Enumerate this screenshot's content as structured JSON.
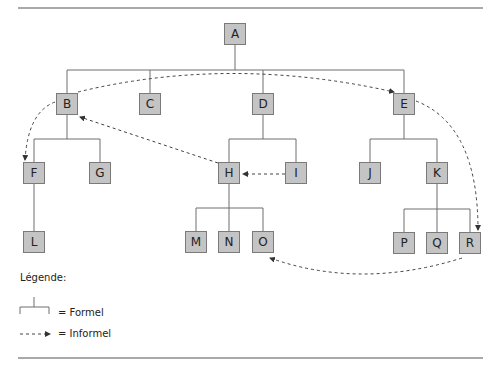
{
  "diagram": {
    "type": "organizational-chart",
    "nodes": [
      {
        "id": "A",
        "label": "A",
        "x": 224,
        "y": 23
      },
      {
        "id": "B",
        "label": "B",
        "x": 56,
        "y": 93
      },
      {
        "id": "C",
        "label": "C",
        "x": 139,
        "y": 93
      },
      {
        "id": "D",
        "label": "D",
        "x": 252,
        "y": 93
      },
      {
        "id": "E",
        "label": "E",
        "x": 393,
        "y": 93
      },
      {
        "id": "F",
        "label": "F",
        "x": 23,
        "y": 162
      },
      {
        "id": "G",
        "label": "G",
        "x": 89,
        "y": 162
      },
      {
        "id": "H",
        "label": "H",
        "x": 218,
        "y": 162
      },
      {
        "id": "I",
        "label": "I",
        "x": 285,
        "y": 162
      },
      {
        "id": "J",
        "label": "J",
        "x": 359,
        "y": 162
      },
      {
        "id": "K",
        "label": "K",
        "x": 426,
        "y": 162
      },
      {
        "id": "L",
        "label": "L",
        "x": 23,
        "y": 231
      },
      {
        "id": "M",
        "label": "M",
        "x": 185,
        "y": 231
      },
      {
        "id": "N",
        "label": "N",
        "x": 218,
        "y": 231
      },
      {
        "id": "O",
        "label": "O",
        "x": 252,
        "y": 231
      },
      {
        "id": "P",
        "label": "P",
        "x": 393,
        "y": 232
      },
      {
        "id": "Q",
        "label": "Q",
        "x": 426,
        "y": 232
      },
      {
        "id": "R",
        "label": "R",
        "x": 459,
        "y": 232
      }
    ],
    "formal_edges": [
      [
        "A",
        "B"
      ],
      [
        "A",
        "C"
      ],
      [
        "A",
        "D"
      ],
      [
        "A",
        "E"
      ],
      [
        "B",
        "F"
      ],
      [
        "B",
        "G"
      ],
      [
        "F",
        "L"
      ],
      [
        "D",
        "H"
      ],
      [
        "D",
        "I"
      ],
      [
        "E",
        "J"
      ],
      [
        "E",
        "K"
      ],
      [
        "H",
        "M"
      ],
      [
        "H",
        "N"
      ],
      [
        "H",
        "O"
      ],
      [
        "K",
        "P"
      ],
      [
        "K",
        "Q"
      ],
      [
        "K",
        "R"
      ]
    ],
    "informal_edges": [
      [
        "B",
        "E"
      ],
      [
        "B",
        "F"
      ],
      [
        "H",
        "B"
      ],
      [
        "I",
        "H"
      ],
      [
        "E",
        "R"
      ],
      [
        "R",
        "O"
      ]
    ]
  },
  "legend": {
    "title": "Légende:",
    "formal_label": "= Formel",
    "informal_label": "= Informel"
  },
  "colors": {
    "box_fill": "#c4c4c4",
    "box_border": "#7a7a7a",
    "line": "#6e6e6e",
    "dash": "#444444"
  }
}
